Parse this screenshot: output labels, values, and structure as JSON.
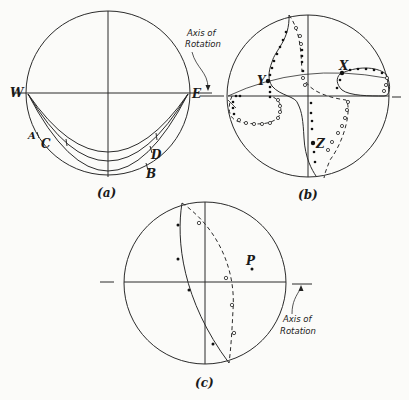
{
  "figure": {
    "panels": [
      {
        "id": "a",
        "caption": "(a)",
        "labels": {
          "west": "W",
          "east": "E",
          "A": "A",
          "B": "B",
          "C": "C",
          "D": "D"
        },
        "annotation": {
          "line1": "Axis of",
          "line2": "Rotation"
        }
      },
      {
        "id": "b",
        "caption": "(b)",
        "labels": {
          "X": "X",
          "Y": "Y",
          "Z": "Z"
        }
      },
      {
        "id": "c",
        "caption": "(c)",
        "labels": {
          "P": "P"
        },
        "annotation": {
          "line1": "Axis of",
          "line2": "Rotation"
        }
      }
    ]
  }
}
